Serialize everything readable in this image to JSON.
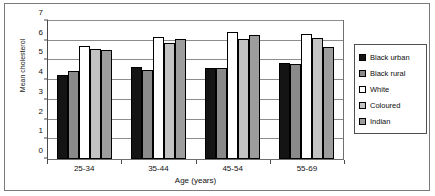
{
  "chart_data": {
    "type": "bar",
    "title": "",
    "xlabel": "Age (years)",
    "ylabel": "Mean cholesterol",
    "categories": [
      "25-34",
      "35-44",
      "45-54",
      "55-69"
    ],
    "series": [
      {
        "name": "Black urban",
        "color": "#141414",
        "values": [
          4.25,
          4.65,
          4.6,
          4.85
        ]
      },
      {
        "name": "Black rural",
        "color": "#8a8a8a",
        "values": [
          4.45,
          4.5,
          4.6,
          4.8
        ]
      },
      {
        "name": "White",
        "color": "#ffffff",
        "values": [
          5.75,
          6.2,
          6.45,
          6.35
        ]
      },
      {
        "name": "Coloured",
        "color": "#c3c3c3",
        "values": [
          5.6,
          5.9,
          6.1,
          6.15
        ]
      },
      {
        "name": "Indian",
        "color": "#9d9d9d",
        "values": [
          5.55,
          6.1,
          6.3,
          5.7
        ]
      }
    ],
    "ylim": [
      0,
      7
    ],
    "yticks": [
      0,
      1,
      2,
      3,
      4,
      5,
      6,
      7
    ],
    "ytick_labels": [
      "0",
      "1",
      "2",
      "3",
      "4",
      "5",
      "6",
      "7"
    ],
    "grid": true,
    "legend_position": "right"
  }
}
